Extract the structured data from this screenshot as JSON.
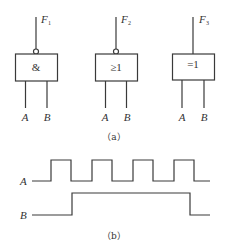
{
  "figure_a": {
    "caption": "（a）",
    "gates": [
      {
        "symbol": "&",
        "output_label": "F",
        "output_sub": "1",
        "inverted_output": true,
        "inputs": [
          "A",
          "B"
        ]
      },
      {
        "symbol": "≥1",
        "output_label": "F",
        "output_sub": "2",
        "inverted_output": true,
        "inputs": [
          "A",
          "B"
        ]
      },
      {
        "symbol": "=1",
        "output_label": "F",
        "output_sub": "3",
        "inverted_output": false,
        "inputs": [
          "A",
          "B"
        ]
      }
    ]
  },
  "figure_b": {
    "caption": "（b）",
    "signals": [
      {
        "name": "A",
        "levels": [
          0,
          1,
          0,
          1,
          0,
          1,
          0,
          1,
          0
        ]
      },
      {
        "name": "B",
        "levels": [
          0,
          0,
          1,
          1,
          1,
          1,
          1,
          1,
          0,
          0
        ]
      }
    ]
  }
}
